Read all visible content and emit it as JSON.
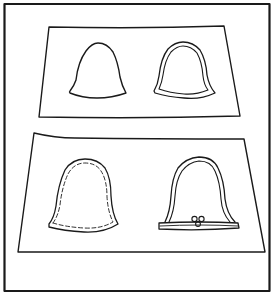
{
  "illustration": {
    "description": "Line drawing of two sheets of paper, each holding two bell-shaped pattern pieces",
    "ink_color": "#1a1a1a",
    "background_color": "#ffffff",
    "frame": {
      "label": "outer-frame"
    },
    "panels": [
      {
        "label": "top-sheet",
        "pieces": [
          {
            "label": "plain-bell-outline",
            "style": "single line"
          },
          {
            "label": "double-outlined-bell",
            "style": "double line"
          }
        ]
      },
      {
        "label": "bottom-sheet",
        "pieces": [
          {
            "label": "stitched-bell",
            "style": "outline with dashed inner stitch line"
          },
          {
            "label": "bound-bell-with-clasp",
            "style": "double line with bound hem and three-ring clasp"
          }
        ]
      }
    ]
  }
}
